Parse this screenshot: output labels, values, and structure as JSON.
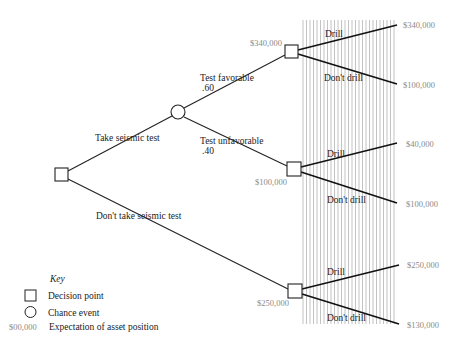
{
  "diagram": {
    "type": "decision-tree",
    "nodes": {
      "root": {
        "kind": "decision"
      },
      "test_chance": {
        "kind": "chance"
      },
      "fav_decision": {
        "kind": "decision",
        "expectation": "$340,000"
      },
      "unfav_decision": {
        "kind": "decision",
        "expectation": "$100,000"
      },
      "notest_decision": {
        "kind": "decision",
        "expectation": "$250,000"
      }
    },
    "branches": {
      "take_test": "Take seismic test",
      "no_test": "Don't take seismic test",
      "favorable": {
        "label": "Test favorable",
        "prob": ".60"
      },
      "unfavorable": {
        "label": "Test unfavorable",
        "prob": ".40"
      },
      "drill": "Drill",
      "dont_drill": "Don't drill"
    },
    "outcomes": {
      "fav_drill": "$340,000",
      "fav_dont": "$100,000",
      "unfav_drill": "$40,000",
      "unfav_dont": "$100,000",
      "notest_drill": "$250,000",
      "notest_dont": "$130,000"
    },
    "key": {
      "title": "Key",
      "decision": "Decision point",
      "chance": "Chance event",
      "expectation_sample": "$00,000",
      "expectation": "Expectation of asset position"
    }
  }
}
